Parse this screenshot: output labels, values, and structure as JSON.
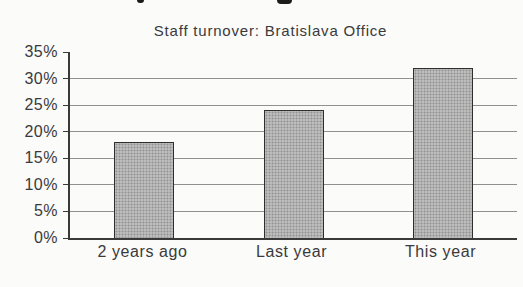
{
  "chart_data": {
    "type": "bar",
    "title": "Staff turnover: Bratislava Office",
    "categories": [
      "2 years ago",
      "Last year",
      "This year"
    ],
    "values": [
      18,
      24,
      32
    ],
    "value_labels": [
      "18%",
      "24%",
      "32%"
    ],
    "xlabel": "",
    "ylabel": "",
    "ylim": [
      0,
      35
    ],
    "ytick_step": 5,
    "yticks": [
      0,
      5,
      10,
      15,
      20,
      25,
      30,
      35
    ],
    "ytick_labels": [
      "0%",
      "5%",
      "10%",
      "15%",
      "20%",
      "25%",
      "30%",
      "35%"
    ],
    "grid": true,
    "legend": false,
    "colors": {
      "bar_fill": "#b2b2b2",
      "bar_border": "#2e2e2e",
      "gridline": "#7d7d7d",
      "axis": "#3a3a3a",
      "text": "#3a3a3a",
      "background": "#fbfbfa"
    }
  }
}
